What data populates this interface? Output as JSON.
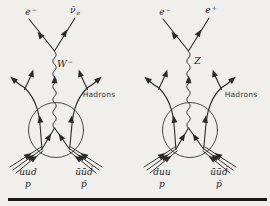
{
  "figure": {
    "paper_color": "#f1efeb",
    "ink_color": "#2d2b27",
    "left_diagram": {
      "top_left_particle": {
        "base": "e",
        "sup": "−",
        "sub": ""
      },
      "top_right_particle": {
        "base": "ν̄",
        "sup": "",
        "sub": "e"
      },
      "boson": {
        "base": "W",
        "sup": "−",
        "sub": ""
      },
      "hadrons_label": "Hadrons",
      "beam_left": {
        "quarks": "uud",
        "particle": "p"
      },
      "beam_right": {
        "quarks": "ūūd̄",
        "particle": "p̄"
      }
    },
    "right_diagram": {
      "top_left_particle": {
        "base": "e",
        "sup": "−",
        "sub": ""
      },
      "top_right_particle": {
        "base": "e",
        "sup": "+",
        "sub": ""
      },
      "boson": {
        "base": "Z",
        "sup": "",
        "sub": ""
      },
      "hadrons_label": "Hadrons",
      "beam_left": {
        "quarks": "duu",
        "particle": "p"
      },
      "beam_right": {
        "quarks": "ūūd̄",
        "particle": "p̄"
      }
    }
  }
}
